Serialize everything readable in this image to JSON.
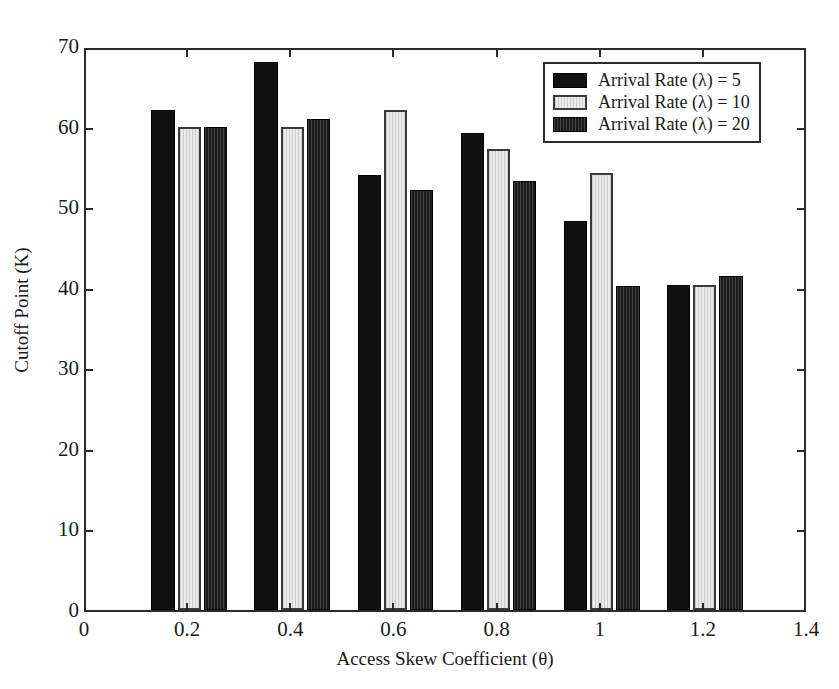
{
  "chart_data": {
    "type": "bar",
    "title": "",
    "xlabel": "Access Skew Coefficient (θ)",
    "ylabel": "Cutoff Point (K)",
    "categories": [
      0.2,
      0.4,
      0.6,
      0.8,
      1.0,
      1.2
    ],
    "xtick_labels": [
      "0",
      "0.2",
      "0.4",
      "0.6",
      "0.8",
      "1",
      "1.2",
      "1.4"
    ],
    "xtick_values": [
      0,
      0.2,
      0.4,
      0.6,
      0.8,
      1.0,
      1.2,
      1.4
    ],
    "ytick_labels": [
      "0",
      "10",
      "20",
      "30",
      "40",
      "50",
      "60",
      "70"
    ],
    "ytick_values": [
      0,
      10,
      20,
      30,
      40,
      50,
      60,
      70
    ],
    "xlim": [
      0,
      1.4
    ],
    "ylim": [
      0,
      70
    ],
    "grid": false,
    "legend_position": "upper right",
    "bar_width": 0.045,
    "series": [
      {
        "name": "Arrival Rate (λ) = 5",
        "color": "#111111",
        "style": "solid-black",
        "values": [
          62.0,
          68.0,
          54.0,
          59.2,
          48.3,
          40.3
        ]
      },
      {
        "name": "Arrival Rate (λ) = 10",
        "color": "#ececec",
        "style": "light-hatched",
        "values": [
          60.0,
          60.0,
          62.0,
          57.2,
          54.3,
          40.3
        ]
      },
      {
        "name": "Arrival Rate (λ) = 20",
        "color": "#1b1b1b",
        "style": "dark-hatched",
        "values": [
          60.0,
          61.0,
          52.1,
          53.2,
          40.2,
          41.4
        ]
      }
    ]
  },
  "legend": {
    "entries": [
      "Arrival Rate (λ) = 5",
      "Arrival Rate (λ) = 10",
      "Arrival Rate (λ) = 20"
    ]
  },
  "axes": {
    "x_label": "Access Skew Coefficient (θ)",
    "y_label": "Cutoff Point (K)"
  }
}
